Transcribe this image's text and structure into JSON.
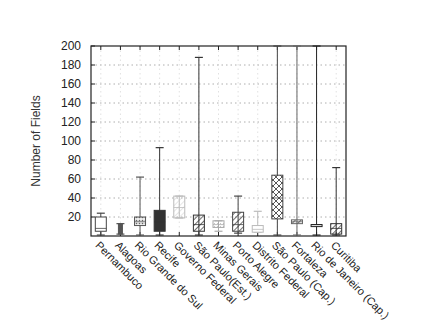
{
  "chart_data": {
    "type": "box",
    "title": "",
    "xlabel": "",
    "ylabel": "Number of Fields",
    "ylim": [
      0,
      200
    ],
    "yticks": [
      20,
      40,
      60,
      80,
      100,
      120,
      140,
      160,
      180,
      200
    ],
    "grid": {
      "horizontal": true,
      "vertical": true,
      "style": "dotted"
    },
    "legend": null,
    "categories": [
      "Pernambuco",
      "Alagoas",
      "Rio Grande do Sul",
      "Recife",
      "Governo Federal",
      "São Paulo(Est.)",
      "Minas Gerais",
      "Porto Alegre",
      "Distrito Federal",
      "São Paulo (Cap.)",
      "Fortaleza",
      "Rio de Janeiro (Cap.)",
      "Curitiba"
    ],
    "series": [
      {
        "name": "Pernambuco",
        "min": 1,
        "q1": 5,
        "median": 8,
        "q3": 20,
        "max": 24,
        "fill": "none",
        "color": "#444"
      },
      {
        "name": "Alagoas",
        "min": 2,
        "q1": 2,
        "median": 8,
        "q3": 13,
        "max": 13,
        "fill": "solid",
        "color": "#555"
      },
      {
        "name": "Rio Grande do Sul",
        "min": 1,
        "q1": 11,
        "median": 15,
        "q3": 20,
        "max": 62,
        "fill": "dots",
        "color": "#555"
      },
      {
        "name": "Recife",
        "min": 1,
        "q1": 5,
        "median": 15,
        "q3": 27,
        "max": 93,
        "fill": "solid",
        "color": "#333"
      },
      {
        "name": "Governo Federal",
        "min": 19,
        "q1": 19,
        "median": 30,
        "q3": 42,
        "max": 42,
        "fill": "hatch",
        "color": "#bbb"
      },
      {
        "name": "São Paulo(Est.)",
        "min": 1,
        "q1": 5,
        "median": 12,
        "q3": 22,
        "max": 188,
        "fill": "hatch",
        "color": "#333"
      },
      {
        "name": "Minas Gerais",
        "min": 5,
        "q1": 9,
        "median": 12,
        "q3": 16,
        "max": 16,
        "fill": "dots",
        "color": "#aaa"
      },
      {
        "name": "Porto Alegre",
        "min": 3,
        "q1": 5,
        "median": 12,
        "q3": 25,
        "max": 42,
        "fill": "hatch",
        "color": "#444"
      },
      {
        "name": "Distrito Federal",
        "min": 4,
        "q1": 4,
        "median": 7,
        "q3": 11,
        "max": 26,
        "fill": "none",
        "color": "#bbb"
      },
      {
        "name": "São Paulo (Cap.)",
        "min": 1,
        "q1": 18,
        "median": 40,
        "q3": 64,
        "max": 200,
        "fill": "crosshatch",
        "color": "#444"
      },
      {
        "name": "Fortaleza",
        "min": 1,
        "q1": 13,
        "median": 15,
        "q3": 17,
        "max": 200,
        "fill": "hatch",
        "color": "#666"
      },
      {
        "name": "Rio de Janeiro (Cap.)",
        "min": 1,
        "q1": 12,
        "median": 12,
        "q3": 12,
        "max": 200,
        "fill": "none",
        "color": "#222"
      },
      {
        "name": "Curitiba",
        "min": 1,
        "q1": 2,
        "median": 8,
        "q3": 13,
        "max": 72,
        "fill": "hatch",
        "color": "#333"
      }
    ]
  }
}
